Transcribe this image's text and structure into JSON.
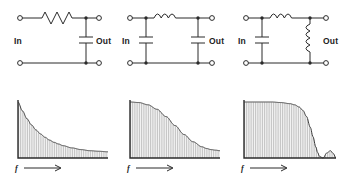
{
  "figure": {
    "columns": [
      {
        "id": "rc-lowpass",
        "circuit": {
          "name": "RC low-pass filter",
          "input_label": "In",
          "output_label": "Out",
          "components": [
            "resistor-series",
            "capacitor-shunt"
          ]
        },
        "graph": {
          "axis_label": "f",
          "axis_arrow": "⟶",
          "response": "gentle-exponential-rolloff"
        }
      },
      {
        "id": "pi-lc-filter",
        "circuit": {
          "name": "Pi LC low-pass filter",
          "input_label": "In",
          "output_label": "Out",
          "components": [
            "capacitor-shunt",
            "inductor-series",
            "capacitor-shunt"
          ]
        },
        "graph": {
          "axis_label": "f",
          "axis_arrow": "⟶",
          "response": "flat-top-steeper-rolloff"
        }
      },
      {
        "id": "lc-shunt-inductor-filter",
        "circuit": {
          "name": "LC filter with shunt inductor",
          "input_label": "In",
          "output_label": "Out",
          "components": [
            "capacitor-shunt",
            "inductor-series",
            "inductor-shunt"
          ]
        },
        "graph": {
          "axis_label": "f",
          "axis_arrow": "⟶",
          "response": "flat-top-sharp-cutoff-with-stopband-bump"
        }
      }
    ],
    "colors": {
      "ink": "#2b2b2b",
      "hatch": "#8d8d8d",
      "background": "#ffffff"
    }
  },
  "chart_data": [
    {
      "type": "area",
      "title": "",
      "xlabel": "f",
      "ylabel": "",
      "xlim": [
        0,
        100
      ],
      "ylim": [
        0,
        100
      ],
      "grid": false,
      "legend": null,
      "series": [
        {
          "name": "RC low-pass response",
          "x": [
            0,
            5,
            10,
            15,
            20,
            25,
            30,
            35,
            40,
            45,
            50,
            60,
            70,
            80,
            90,
            100
          ],
          "values": [
            100,
            84,
            70,
            59,
            50,
            43,
            37,
            32,
            28,
            25,
            22,
            18,
            15,
            13,
            12,
            11
          ]
        }
      ]
    },
    {
      "type": "area",
      "title": "",
      "xlabel": "f",
      "ylabel": "",
      "xlim": [
        0,
        100
      ],
      "ylim": [
        0,
        100
      ],
      "grid": false,
      "legend": null,
      "series": [
        {
          "name": "Pi LC low-pass response",
          "x": [
            0,
            10,
            20,
            30,
            40,
            50,
            60,
            70,
            80,
            85,
            90,
            95,
            100
          ],
          "values": [
            100,
            99,
            95,
            87,
            74,
            58,
            42,
            29,
            20,
            17,
            15,
            14,
            13
          ]
        }
      ]
    },
    {
      "type": "area",
      "title": "",
      "xlabel": "f",
      "ylabel": "",
      "xlim": [
        0,
        100
      ],
      "ylim": [
        0,
        100
      ],
      "grid": false,
      "legend": null,
      "series": [
        {
          "name": "LC sharp-cutoff response",
          "x": [
            0,
            10,
            20,
            30,
            40,
            50,
            55,
            60,
            64,
            68,
            72,
            75,
            78,
            80,
            82,
            86,
            90,
            94,
            97,
            100
          ],
          "values": [
            100,
            100,
            100,
            100,
            99,
            97,
            95,
            91,
            85,
            74,
            55,
            38,
            20,
            10,
            3,
            0,
            9,
            13,
            8,
            0
          ]
        }
      ]
    }
  ]
}
